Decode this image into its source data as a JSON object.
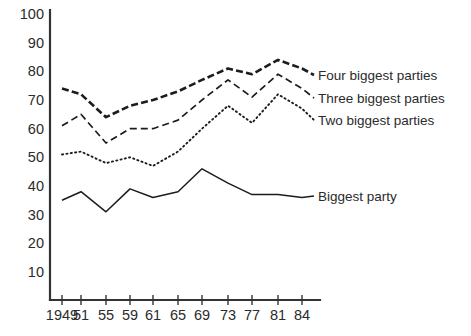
{
  "chart_data": {
    "type": "line",
    "title": "",
    "xlabel": "",
    "ylabel": "",
    "grid": false,
    "legend_position": "right-inline",
    "x": [
      1949,
      1951,
      1955,
      1959,
      1961,
      1965,
      1969,
      1973,
      1977,
      1981,
      1984
    ],
    "xtick_labels": [
      "1949",
      "51",
      "55",
      "59",
      "61",
      "65",
      "69",
      "73",
      "77",
      "81",
      "84"
    ],
    "ytick_labels": [
      "100",
      "90",
      "80",
      "70",
      "60",
      "50",
      "40",
      "30",
      "20",
      "10"
    ],
    "ytick_values": [
      100,
      90,
      80,
      70,
      60,
      50,
      40,
      30,
      20,
      10
    ],
    "ylim": [
      0,
      100
    ],
    "series": [
      {
        "name": "Four biggest parties",
        "style": "dashed-thick",
        "values": [
          74,
          72,
          64,
          68,
          70,
          73,
          77,
          81,
          79,
          84,
          81
        ]
      },
      {
        "name": "Three biggest parties",
        "style": "dashed-thin",
        "values": [
          61,
          65,
          55,
          60,
          60,
          63,
          70,
          77,
          71,
          79,
          74
        ]
      },
      {
        "name": "Two biggest parties",
        "style": "dotted",
        "values": [
          51,
          52,
          48,
          50,
          47,
          52,
          60,
          68,
          62,
          72,
          67
        ]
      },
      {
        "name": "Biggest party",
        "style": "solid",
        "values": [
          35,
          38,
          31,
          39,
          36,
          38,
          46,
          41,
          37,
          37,
          36
        ]
      }
    ],
    "legend": [
      {
        "label": "Four biggest parties"
      },
      {
        "label": "Three biggest parties"
      },
      {
        "label": "Two biggest parties"
      },
      {
        "label": "Biggest party"
      }
    ],
    "colors": {
      "line": "#1c1c1c",
      "axis": "#333333",
      "text": "#2b2b2b",
      "background": "#ffffff"
    }
  }
}
